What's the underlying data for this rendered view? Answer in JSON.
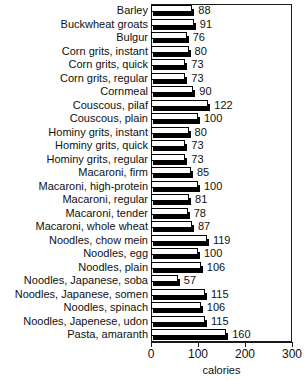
{
  "chart_data": {
    "type": "bar",
    "orientation": "horizontal",
    "title": "",
    "xlabel": "calories",
    "ylabel": "",
    "xlim": [
      0,
      300
    ],
    "xticks": [
      0,
      100,
      200,
      300
    ],
    "xtick_labels": [
      "0",
      "100",
      "200",
      "300"
    ],
    "grid": false,
    "legend": null,
    "categories": [
      "Barley",
      "Buckwheat groats",
      "Bulgur",
      "Corn grits, instant",
      "Corn grits, quick",
      "Corn grits, regular",
      "Cornmeal",
      "Couscous, pilaf",
      "Couscous, plain",
      "Hominy grits, instant",
      "Hominy grits, quick",
      "Hominy grits, regular",
      "Macaroni, firm",
      "Macaroni, high-protein",
      "Macaroni, regular",
      "Macaroni, tender",
      "Macaroni, whole wheat",
      "Noodles, chow mein",
      "Noodles, egg",
      "Noodles, plain",
      "Noodles, Japanese, soba",
      "Noodles, Japanese, somen",
      "Noodles, spinach",
      "Noodles, Japenese, udon",
      "Pasta, amaranth"
    ],
    "values": [
      88,
      91,
      76,
      80,
      73,
      73,
      90,
      122,
      100,
      80,
      73,
      73,
      85,
      100,
      81,
      78,
      87,
      119,
      100,
      106,
      57,
      115,
      106,
      115,
      160
    ],
    "value_labels": [
      "88",
      "91",
      "76",
      "80",
      "73",
      "73",
      "90",
      "122",
      "100",
      "80",
      "73",
      "73",
      "85",
      "100",
      "81",
      "78",
      "87",
      "119",
      "100",
      "106",
      "57",
      "115",
      "106",
      "115",
      "160"
    ]
  },
  "style": {
    "bar_face_color": "#ffffff",
    "bar_edge_color": "#000000",
    "bar_shadow_color": "#000000",
    "axis_color": "#1a1a1a",
    "text_color": "#101010",
    "background": "#ffffff"
  }
}
